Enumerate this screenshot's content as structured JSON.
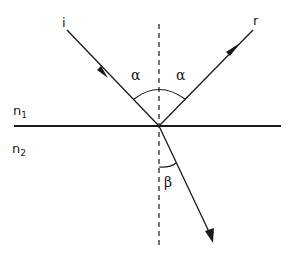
{
  "diagram": {
    "type": "optics-reflection-refraction",
    "colors": {
      "line": "#1a1a1a",
      "background": "#ffffff"
    },
    "labels": {
      "incident": "i",
      "reflected": "r",
      "alpha_left": "α",
      "alpha_right": "α",
      "beta": "β",
      "medium1": {
        "base": "n",
        "sub": "1"
      },
      "medium2": {
        "base": "n",
        "sub": "2"
      }
    },
    "elements": {
      "interface_line": "interface between media",
      "normal_line": "dashed normal",
      "incident_ray": "incident ray with arrow",
      "reflected_ray": "reflected ray with arrow",
      "refracted_ray": "refracted ray with arrowhead",
      "angle_arc_alpha": "arc spanning incidence and reflection angles",
      "angle_arc_beta": "arc for refraction angle"
    }
  }
}
